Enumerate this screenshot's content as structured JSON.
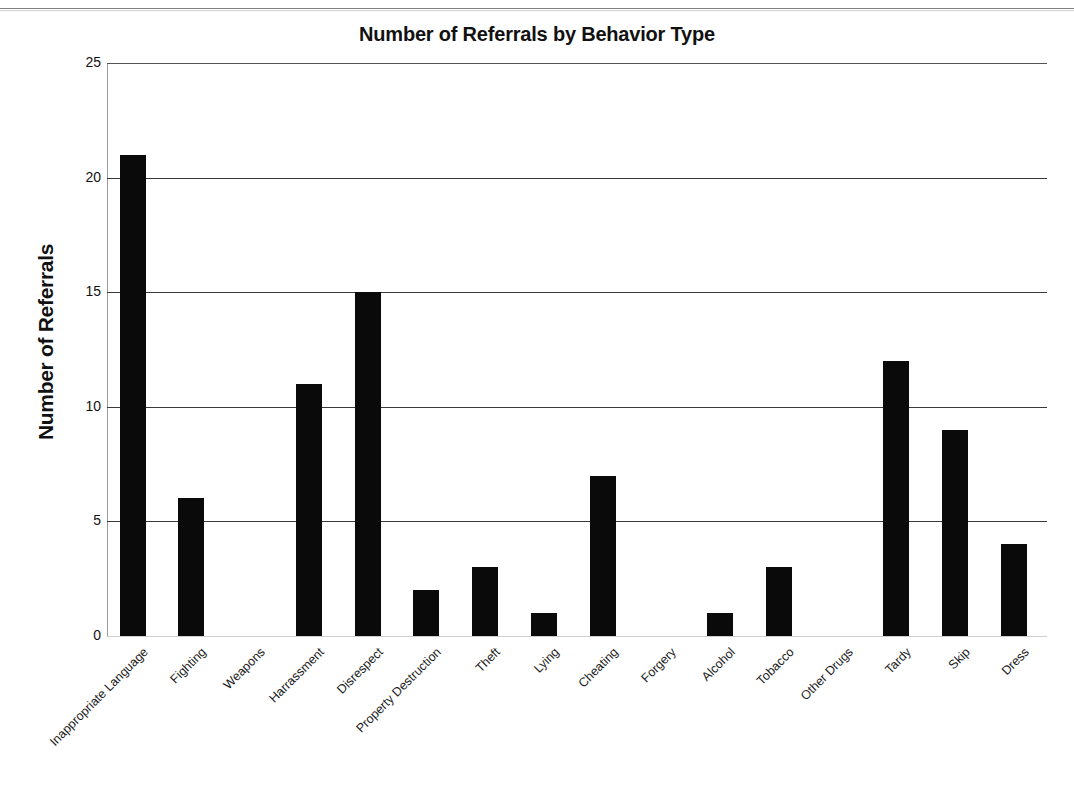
{
  "chart_data": {
    "type": "bar",
    "title": "Number of Referrals by Behavior Type",
    "xlabel": "",
    "ylabel": "Number of Referrals",
    "ylim": [
      0,
      25
    ],
    "yticks": [
      "0",
      "5",
      "10",
      "15",
      "20",
      "25"
    ],
    "grid": true,
    "legend": "none",
    "bar_color": "#0a0a0a",
    "categories": [
      "Inappropriate Language",
      "Fighting",
      "Weapons",
      "Harrassment",
      "Disrespect",
      "Property Destruction",
      "Theft",
      "Lying",
      "Cheating",
      "Forgery",
      "Alcohol",
      "Tobacco",
      "Other Drugs",
      "Tardy",
      "Skip",
      "Dress"
    ],
    "values": [
      21,
      6,
      0,
      11,
      15,
      2,
      3,
      1,
      7,
      0,
      1,
      3,
      0,
      12,
      9,
      4
    ]
  }
}
